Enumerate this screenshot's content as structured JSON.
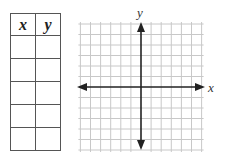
{
  "table": {
    "headers": [
      "x",
      "y"
    ],
    "rows": [
      [
        "",
        ""
      ],
      [
        "",
        ""
      ],
      [
        "",
        ""
      ],
      [
        "",
        ""
      ],
      [
        "",
        ""
      ]
    ]
  },
  "graph": {
    "x_axis_label": "x",
    "y_axis_label": "y",
    "grid_color": "#c8c8c8",
    "axis_color": "#222222",
    "grid_lines_each_direction": 13
  }
}
